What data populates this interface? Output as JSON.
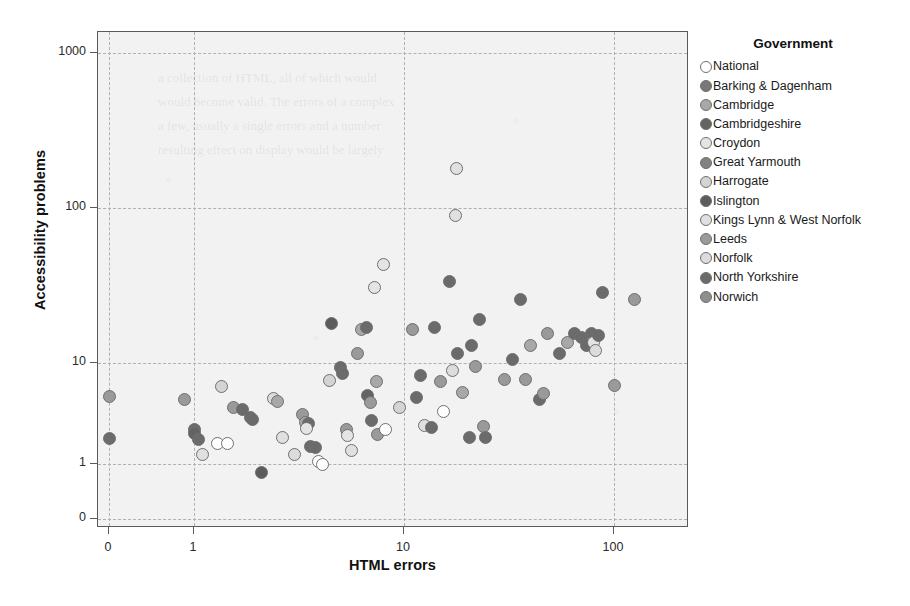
{
  "chart_data": {
    "type": "scatter",
    "title": "",
    "xlabel": "HTML errors",
    "ylabel": "Accessibility problems",
    "xscale": "log",
    "yscale": "log",
    "grid": true,
    "legend_position": "right",
    "legend_title": "Government",
    "xticks": [
      "0",
      "1",
      "10",
      "100"
    ],
    "xtick_values": [
      0,
      1,
      10,
      100
    ],
    "yticks": [
      "0",
      "1",
      "10",
      "100",
      "1000"
    ],
    "ytick_values": [
      0,
      1,
      10,
      100,
      1000
    ],
    "xlim": [
      0,
      160
    ],
    "ylim": [
      0,
      1400
    ],
    "series": [
      {
        "name": "National",
        "color": "#ffffff"
      },
      {
        "name": "Barking & Dagenham",
        "color": "#787878"
      },
      {
        "name": "Cambridge",
        "color": "#a8a8a8"
      },
      {
        "name": "Cambridgeshire",
        "color": "#636363"
      },
      {
        "name": "Croydon",
        "color": "#e4e4e4"
      },
      {
        "name": "Great Yarmouth",
        "color": "#828282"
      },
      {
        "name": "Harrogate",
        "color": "#d4d4d4"
      },
      {
        "name": "Islington",
        "color": "#5c5c5c"
      },
      {
        "name": "Kings Lynn & West Norfolk",
        "color": "#e0e0e0"
      },
      {
        "name": "Leeds",
        "color": "#9a9a9a"
      },
      {
        "name": "Norfolk",
        "color": "#dcdcdc"
      },
      {
        "name": "North Yorkshire",
        "color": "#6b6b6b"
      },
      {
        "name": "Norwich",
        "color": "#8e8e8e"
      }
    ],
    "points": [
      {
        "x": 0,
        "y": 4.7,
        "s": 9
      },
      {
        "x": 0,
        "y": 1.8,
        "s": 11
      },
      {
        "x": 0.9,
        "y": 4.4,
        "s": 9
      },
      {
        "x": 1.0,
        "y": 2.2,
        "s": 11
      },
      {
        "x": 1.0,
        "y": 2.0,
        "s": 3
      },
      {
        "x": 1.05,
        "y": 1.75,
        "s": 11
      },
      {
        "x": 1.1,
        "y": 1.25,
        "s": 8
      },
      {
        "x": 1.35,
        "y": 5.9,
        "s": 6
      },
      {
        "x": 1.3,
        "y": 1.6,
        "s": 0
      },
      {
        "x": 1.45,
        "y": 1.6,
        "s": 0
      },
      {
        "x": 1.55,
        "y": 3.6,
        "s": 9
      },
      {
        "x": 1.7,
        "y": 3.5,
        "s": 11
      },
      {
        "x": 1.85,
        "y": 2.9,
        "s": 11
      },
      {
        "x": 1.9,
        "y": 2.75,
        "s": 11
      },
      {
        "x": 2.1,
        "y": 0.82,
        "s": 7
      },
      {
        "x": 2.4,
        "y": 4.5,
        "s": 10
      },
      {
        "x": 2.5,
        "y": 4.2,
        "s": 2
      },
      {
        "x": 2.65,
        "y": 1.85,
        "s": 8
      },
      {
        "x": 3.0,
        "y": 1.25,
        "s": 10
      },
      {
        "x": 3.3,
        "y": 3.1,
        "s": 9
      },
      {
        "x": 3.4,
        "y": 2.6,
        "s": 2
      },
      {
        "x": 3.5,
        "y": 2.5,
        "s": 11
      },
      {
        "x": 3.45,
        "y": 2.25,
        "s": 4
      },
      {
        "x": 3.6,
        "y": 1.5,
        "s": 11
      },
      {
        "x": 3.8,
        "y": 1.45,
        "s": 11
      },
      {
        "x": 3.9,
        "y": 1.05,
        "s": 0
      },
      {
        "x": 4.1,
        "y": 1.0,
        "s": 0
      },
      {
        "x": 4.4,
        "y": 6.7,
        "s": 6
      },
      {
        "x": 4.5,
        "y": 18.0,
        "s": 7
      },
      {
        "x": 5.0,
        "y": 9.0,
        "s": 11
      },
      {
        "x": 5.1,
        "y": 7.8,
        "s": 11
      },
      {
        "x": 5.3,
        "y": 2.2,
        "s": 9
      },
      {
        "x": 5.4,
        "y": 1.9,
        "s": 4
      },
      {
        "x": 5.6,
        "y": 1.35,
        "s": 8
      },
      {
        "x": 6.0,
        "y": 11.5,
        "s": 9
      },
      {
        "x": 6.3,
        "y": 16.5,
        "s": 2
      },
      {
        "x": 6.6,
        "y": 17.0,
        "s": 11
      },
      {
        "x": 6.7,
        "y": 4.8,
        "s": 3
      },
      {
        "x": 6.9,
        "y": 4.1,
        "s": 9
      },
      {
        "x": 7.0,
        "y": 2.7,
        "s": 11
      },
      {
        "x": 7.2,
        "y": 30.5,
        "s": 4
      },
      {
        "x": 7.4,
        "y": 6.5,
        "s": 2
      },
      {
        "x": 7.5,
        "y": 1.95,
        "s": 9
      },
      {
        "x": 8.0,
        "y": 43.0,
        "s": 4
      },
      {
        "x": 8.2,
        "y": 2.2,
        "s": 0
      },
      {
        "x": 9.5,
        "y": 3.6,
        "s": 6
      },
      {
        "x": 11.0,
        "y": 16.5,
        "s": 9
      },
      {
        "x": 11.5,
        "y": 4.6,
        "s": 11
      },
      {
        "x": 12.0,
        "y": 7.5,
        "s": 11
      },
      {
        "x": 12.5,
        "y": 2.4,
        "s": 8
      },
      {
        "x": 13.5,
        "y": 2.3,
        "s": 11
      },
      {
        "x": 14.0,
        "y": 17.0,
        "s": 11
      },
      {
        "x": 15.0,
        "y": 6.5,
        "s": 9
      },
      {
        "x": 15.5,
        "y": 3.3,
        "s": 0
      },
      {
        "x": 16.5,
        "y": 33.5,
        "s": 11
      },
      {
        "x": 17.0,
        "y": 8.5,
        "s": 10
      },
      {
        "x": 17.5,
        "y": 90.0,
        "s": 8
      },
      {
        "x": 17.8,
        "y": 180.0,
        "s": 8
      },
      {
        "x": 18.0,
        "y": 11.5,
        "s": 11
      },
      {
        "x": 19.0,
        "y": 5.1,
        "s": 2
      },
      {
        "x": 20.5,
        "y": 1.85,
        "s": 11
      },
      {
        "x": 21.0,
        "y": 13.0,
        "s": 11
      },
      {
        "x": 22.0,
        "y": 9.2,
        "s": 9
      },
      {
        "x": 23.0,
        "y": 19.0,
        "s": 11
      },
      {
        "x": 24.0,
        "y": 2.35,
        "s": 9
      },
      {
        "x": 24.5,
        "y": 1.85,
        "s": 11
      },
      {
        "x": 30.0,
        "y": 6.9,
        "s": 9
      },
      {
        "x": 33.0,
        "y": 10.5,
        "s": 11
      },
      {
        "x": 36.0,
        "y": 25.5,
        "s": 11
      },
      {
        "x": 38.0,
        "y": 6.9,
        "s": 9
      },
      {
        "x": 40.0,
        "y": 13.0,
        "s": 2
      },
      {
        "x": 44.0,
        "y": 4.4,
        "s": 11
      },
      {
        "x": 46.0,
        "y": 5.0,
        "s": 9
      },
      {
        "x": 48.0,
        "y": 15.5,
        "s": 9
      },
      {
        "x": 55.0,
        "y": 11.5,
        "s": 11
      },
      {
        "x": 60.0,
        "y": 13.5,
        "s": 2
      },
      {
        "x": 65.0,
        "y": 15.5,
        "s": 11
      },
      {
        "x": 70.0,
        "y": 14.5,
        "s": 11
      },
      {
        "x": 74.0,
        "y": 13.0,
        "s": 11
      },
      {
        "x": 78.0,
        "y": 15.5,
        "s": 11
      },
      {
        "x": 80.0,
        "y": 13.5,
        "s": 4
      },
      {
        "x": 82.0,
        "y": 12.0,
        "s": 10
      },
      {
        "x": 84.0,
        "y": 15.0,
        "s": 11
      },
      {
        "x": 88.0,
        "y": 28.5,
        "s": 11
      },
      {
        "x": 100.0,
        "y": 6.0,
        "s": 9
      },
      {
        "x": 125.0,
        "y": 25.5,
        "s": 9
      }
    ]
  }
}
